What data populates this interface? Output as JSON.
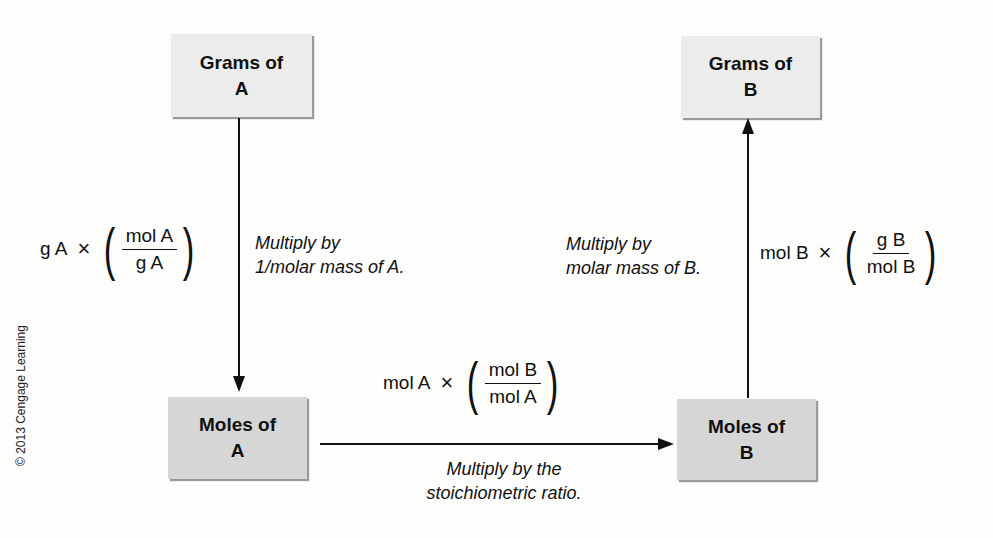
{
  "boxes": {
    "grams_a": {
      "line1": "Grams of",
      "line2": "A"
    },
    "grams_b": {
      "line1": "Grams of",
      "line2": "B"
    },
    "moles_a": {
      "line1": "Moles of",
      "line2": "A"
    },
    "moles_b": {
      "line1": "Moles of",
      "line2": "B"
    }
  },
  "steps": {
    "grams_to_moles_a": {
      "formula": {
        "term": "g A",
        "operator": "×",
        "numerator": "mol A",
        "denominator": "g A"
      },
      "note_line1": "Multiply by",
      "note_line2": "1/molar mass of A."
    },
    "moles_a_to_moles_b": {
      "formula": {
        "term": "mol A",
        "operator": "×",
        "numerator": "mol B",
        "denominator": "mol A"
      },
      "note_line1": "Multiply by the",
      "note_line2": "stoichiometric ratio."
    },
    "moles_to_grams_b": {
      "formula": {
        "term": "mol B",
        "operator": "×",
        "numerator": "g B",
        "denominator": "mol B"
      },
      "note_line1": "Multiply by",
      "note_line2": "molar mass of B."
    }
  },
  "credit": "© 2013 Cengage Learning",
  "colors": {
    "box_light": "#ececec",
    "box_dark": "#d6d6d6",
    "line": "#111111"
  }
}
